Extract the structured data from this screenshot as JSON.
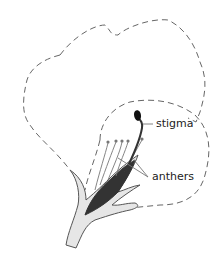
{
  "diagram": {
    "labels": {
      "stigma": "stigma",
      "anthers": "anthers"
    },
    "colors": {
      "outline": "#555555",
      "dashed": "#666666",
      "stem_fill": "#e6e6e6",
      "ovary_fill": "#333333",
      "text": "#222222"
    }
  }
}
